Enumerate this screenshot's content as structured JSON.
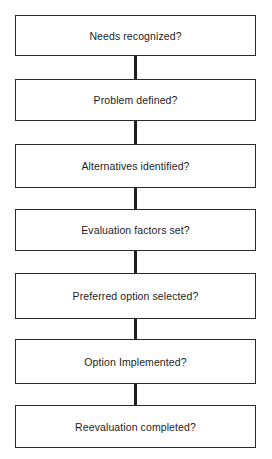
{
  "diagram": {
    "type": "vertical-flowchart",
    "steps": [
      {
        "label": "Needs recognized?"
      },
      {
        "label": "Problem defined?"
      },
      {
        "label": "Alternatives identified?"
      },
      {
        "label": "Evaluation factors set?"
      },
      {
        "label": "Preferred option selected?"
      },
      {
        "label": "Option Implemented?"
      },
      {
        "label": "Reevaluation completed?"
      }
    ],
    "colors": {
      "line": "#1e1e1e",
      "border": "#2a2a2a",
      "text": "#1c1c1c",
      "background": "#ffffff"
    }
  }
}
